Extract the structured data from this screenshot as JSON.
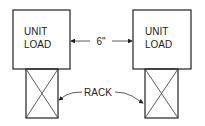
{
  "diagram": {
    "unit_loads": [
      {
        "line1": "UNIT",
        "line2": "LOAD"
      },
      {
        "line1": "UNIT",
        "line2": "LOAD"
      }
    ],
    "spacing_label": "6\"",
    "rack_label": "RACK",
    "colors": {
      "stroke": "#222222",
      "background": "#ffffff"
    }
  }
}
